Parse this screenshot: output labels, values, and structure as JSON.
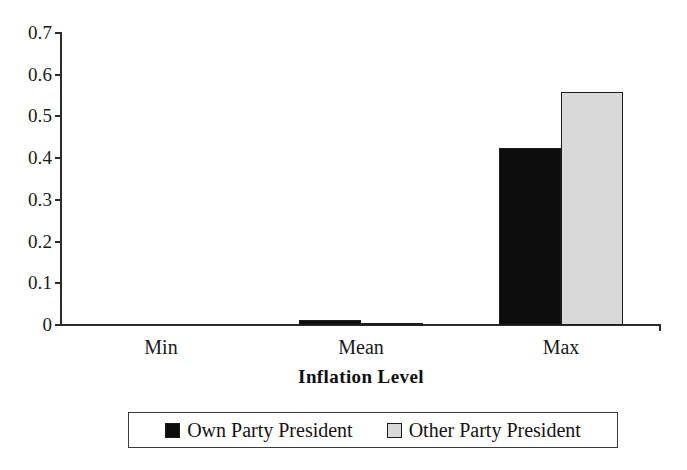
{
  "chart_data": {
    "type": "bar",
    "title": "",
    "xlabel": "Inflation Level",
    "ylabel": "",
    "categories": [
      "Min",
      "Mean",
      "Max"
    ],
    "series": [
      {
        "name": "Own Party President",
        "color": "#0d0d0d",
        "values": [
          0.0,
          0.011,
          0.424
        ]
      },
      {
        "name": "Other Party President",
        "color": "#d9d9d9",
        "values": [
          0.0,
          0.004,
          0.558
        ]
      }
    ],
    "ylim": [
      0,
      0.7
    ],
    "ytick_values": [
      0.7,
      0.6,
      0.5,
      0.4,
      0.3,
      0.2,
      0.1,
      0
    ],
    "ytick_labels": [
      "0.7",
      "0.6",
      "0.5",
      "0.4",
      "0.3",
      "0.2",
      "0.1",
      "0"
    ],
    "grid": false,
    "legend_position": "bottom"
  },
  "axis": {
    "x_title": "Inflation Level",
    "tick_labels": [
      "0.7",
      "0.6",
      "0.5",
      "0.4",
      "0.3",
      "0.2",
      "0.1",
      "0"
    ]
  },
  "categories": {
    "labels": [
      "Min",
      "Mean",
      "Max"
    ]
  },
  "legend": {
    "entries": [
      {
        "label": "Own Party President",
        "swatch": "black-square-icon"
      },
      {
        "label": "Other Party President",
        "swatch": "gray-square-icon"
      }
    ]
  }
}
